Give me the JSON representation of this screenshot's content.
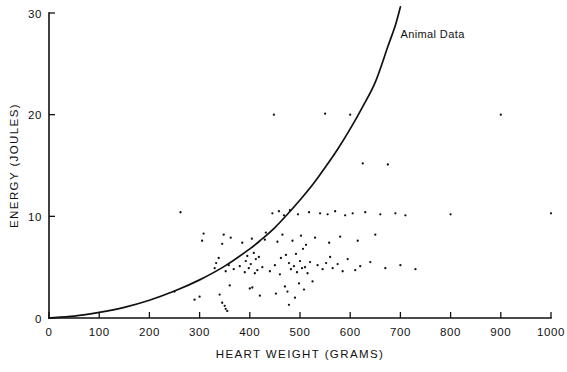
{
  "chart_data": {
    "type": "scatter",
    "title": "",
    "xlabel": "HEART  WEIGHT  (GRAMS)",
    "ylabel": "ENERGY  (JOULES)",
    "xlim": [
      0,
      1000
    ],
    "ylim": [
      0,
      30
    ],
    "grid": false,
    "legend_position": "none",
    "xticks": [
      0,
      100,
      200,
      300,
      400,
      500,
      600,
      700,
      800,
      900,
      1000
    ],
    "xtick_labels": [
      "0",
      "100",
      "200",
      "300",
      "400",
      "500",
      "600",
      "700",
      "800",
      "900",
      "1000"
    ],
    "yticks": [
      0,
      10,
      20,
      30
    ],
    "ytick_labels": [
      "0",
      "10",
      "20",
      "30"
    ],
    "annotations": [
      {
        "text": "Animal Data",
        "x": 700,
        "y": 27.5
      }
    ],
    "series": [
      {
        "name": "Animal Data",
        "type": "line",
        "comment": "fitted power/quadratic curve rising from origin to about 30.5 J at 700 g",
        "points": [
          [
            0,
            0
          ],
          [
            50,
            0.18
          ],
          [
            100,
            0.55
          ],
          [
            150,
            1.05
          ],
          [
            200,
            1.75
          ],
          [
            250,
            2.65
          ],
          [
            300,
            3.75
          ],
          [
            350,
            5.1
          ],
          [
            400,
            6.8
          ],
          [
            425,
            7.8
          ],
          [
            450,
            8.9
          ],
          [
            475,
            10.2
          ],
          [
            500,
            11.6
          ],
          [
            525,
            13.1
          ],
          [
            550,
            14.8
          ],
          [
            575,
            16.6
          ],
          [
            600,
            18.6
          ],
          [
            625,
            20.8
          ],
          [
            650,
            23.2
          ],
          [
            675,
            26.7
          ],
          [
            690,
            28.8
          ],
          [
            700,
            30.6
          ]
        ]
      },
      {
        "name": "Measured points",
        "type": "scatter",
        "points": [
          [
            250,
            2.6
          ],
          [
            262,
            10.4
          ],
          [
            300,
            2.1
          ],
          [
            305,
            7.6
          ],
          [
            308,
            8.3
          ],
          [
            330,
            4.9
          ],
          [
            333,
            5.4
          ],
          [
            338,
            5.9
          ],
          [
            340,
            2.3
          ],
          [
            345,
            7.3
          ],
          [
            348,
            8.2
          ],
          [
            350,
            1.2
          ],
          [
            352,
            4.6
          ],
          [
            355,
            0.7
          ],
          [
            358,
            5.2
          ],
          [
            360,
            3.2
          ],
          [
            362,
            7.9
          ],
          [
            368,
            4.8
          ],
          [
            380,
            5.1
          ],
          [
            385,
            7.4
          ],
          [
            390,
            4.5
          ],
          [
            392,
            5.6
          ],
          [
            395,
            6.1
          ],
          [
            398,
            4.9
          ],
          [
            400,
            2.9
          ],
          [
            402,
            5.3
          ],
          [
            404,
            7.8
          ],
          [
            405,
            3.0
          ],
          [
            408,
            6.4
          ],
          [
            410,
            4.4
          ],
          [
            412,
            5.8
          ],
          [
            415,
            4.7
          ],
          [
            418,
            6.0
          ],
          [
            420,
            2.2
          ],
          [
            425,
            5.0
          ],
          [
            430,
            7.7
          ],
          [
            432,
            8.4
          ],
          [
            440,
            4.6
          ],
          [
            445,
            10.3
          ],
          [
            448,
            20.0
          ],
          [
            450,
            5.2
          ],
          [
            452,
            2.4
          ],
          [
            455,
            7.5
          ],
          [
            458,
            10.5
          ],
          [
            460,
            4.3
          ],
          [
            462,
            5.9
          ],
          [
            465,
            8.2
          ],
          [
            468,
            10.1
          ],
          [
            470,
            3.1
          ],
          [
            472,
            6.2
          ],
          [
            475,
            2.6
          ],
          [
            478,
            5.4
          ],
          [
            480,
            10.6
          ],
          [
            482,
            4.8
          ],
          [
            485,
            7.6
          ],
          [
            488,
            5.1
          ],
          [
            490,
            2.0
          ],
          [
            492,
            6.3
          ],
          [
            494,
            4.5
          ],
          [
            496,
            10.2
          ],
          [
            498,
            3.4
          ],
          [
            500,
            5.6
          ],
          [
            502,
            8.1
          ],
          [
            504,
            4.9
          ],
          [
            506,
            6.8
          ],
          [
            508,
            2.8
          ],
          [
            510,
            5.0
          ],
          [
            512,
            7.2
          ],
          [
            515,
            4.4
          ],
          [
            518,
            10.4
          ],
          [
            520,
            5.5
          ],
          [
            525,
            3.6
          ],
          [
            530,
            7.9
          ],
          [
            535,
            5.2
          ],
          [
            540,
            10.3
          ],
          [
            545,
            4.8
          ],
          [
            550,
            20.1
          ],
          [
            552,
            5.4
          ],
          [
            555,
            10.2
          ],
          [
            558,
            7.4
          ],
          [
            560,
            6.0
          ],
          [
            565,
            4.9
          ],
          [
            570,
            10.5
          ],
          [
            575,
            5.3
          ],
          [
            580,
            8.0
          ],
          [
            585,
            4.6
          ],
          [
            590,
            10.1
          ],
          [
            595,
            5.8
          ],
          [
            600,
            20.0
          ],
          [
            605,
            10.3
          ],
          [
            610,
            4.7
          ],
          [
            615,
            7.6
          ],
          [
            620,
            5.1
          ],
          [
            625,
            15.2
          ],
          [
            630,
            10.4
          ],
          [
            640,
            5.5
          ],
          [
            650,
            8.2
          ],
          [
            660,
            10.2
          ],
          [
            670,
            4.9
          ],
          [
            675,
            15.1
          ],
          [
            690,
            10.3
          ],
          [
            700,
            5.2
          ],
          [
            710,
            10.1
          ],
          [
            730,
            4.8
          ],
          [
            800,
            10.2
          ],
          [
            900,
            20.0
          ],
          [
            1000,
            10.3
          ],
          [
            345,
            1.5
          ],
          [
            478,
            1.3
          ],
          [
            352,
            0.9
          ],
          [
            290,
            1.8
          ]
        ]
      }
    ]
  }
}
